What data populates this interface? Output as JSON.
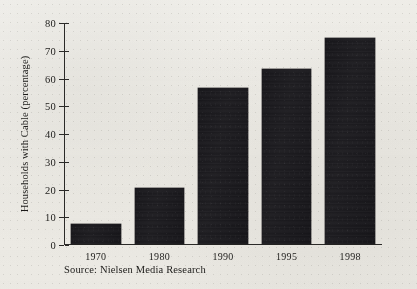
{
  "chart_data": {
    "type": "bar",
    "title": "",
    "subtitle": "",
    "xlabel": "",
    "ylabel": "Households with Cable (percentage)",
    "categories": [
      "1970",
      "1980",
      "1990",
      "1995",
      "1998"
    ],
    "values": [
      7,
      20,
      56,
      63,
      74
    ],
    "ylim": [
      0,
      80
    ],
    "yticks": [
      0,
      10,
      20,
      30,
      40,
      50,
      60,
      70,
      80
    ],
    "ytick_labels": [
      "0",
      "10",
      "20",
      "30",
      "40",
      "50",
      "60",
      "70",
      "80"
    ],
    "grid": false,
    "legend": null,
    "bar_color": "#18171b",
    "background_color": "#efeeea",
    "axis_color": "#2b2a28",
    "annotations": [
      {
        "name": "source-note",
        "text": "Source: Nielsen Media Research"
      }
    ]
  },
  "figure": {
    "source_note": "Source: Nielsen Media Research",
    "y_axis_title": "Households with Cable (percentage)"
  }
}
